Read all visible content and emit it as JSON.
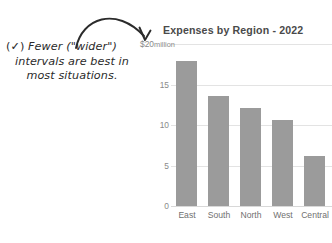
{
  "annotation": {
    "check_glyph": "(✓)",
    "line1": "Fewer (\"wider\")",
    "line2": "intervals are best in",
    "line3": "most situations.",
    "arrow": "curved-arrow-icon",
    "color": "#2b2b2b"
  },
  "chart_data": {
    "type": "bar",
    "title": "Expenses by Region - 2022",
    "categories": [
      "East",
      "South",
      "North",
      "West",
      "Central"
    ],
    "values": [
      17.9,
      13.6,
      12.1,
      10.6,
      6.2
    ],
    "xlabel": "",
    "ylabel": "",
    "y_axis_top_label": "$20",
    "y_axis_unit": "million",
    "yticks": [
      0,
      5,
      10,
      15,
      20
    ],
    "ytick_labels": [
      "0",
      "5",
      "10",
      "15",
      "$20 million"
    ],
    "ylim": [
      0,
      20
    ],
    "grid": true,
    "legend": "none",
    "bar_color": "#9b9b9b",
    "grid_color": "#e3e3e3",
    "title_color": "#4a4a4a",
    "tick_color": "#8a8a8a"
  }
}
